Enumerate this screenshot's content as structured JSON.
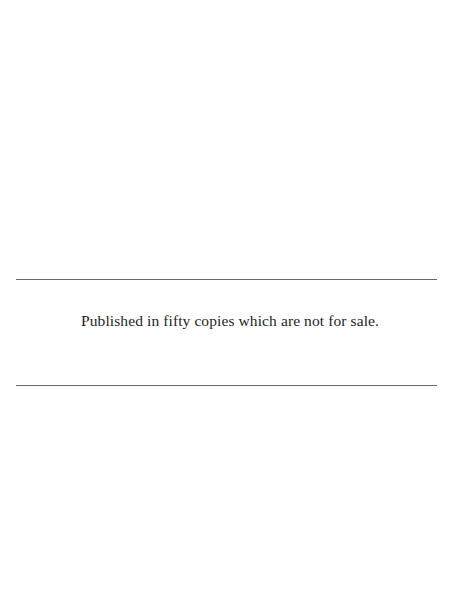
{
  "page": {
    "colophon_text": "Published in fifty copies which are not for sale."
  }
}
